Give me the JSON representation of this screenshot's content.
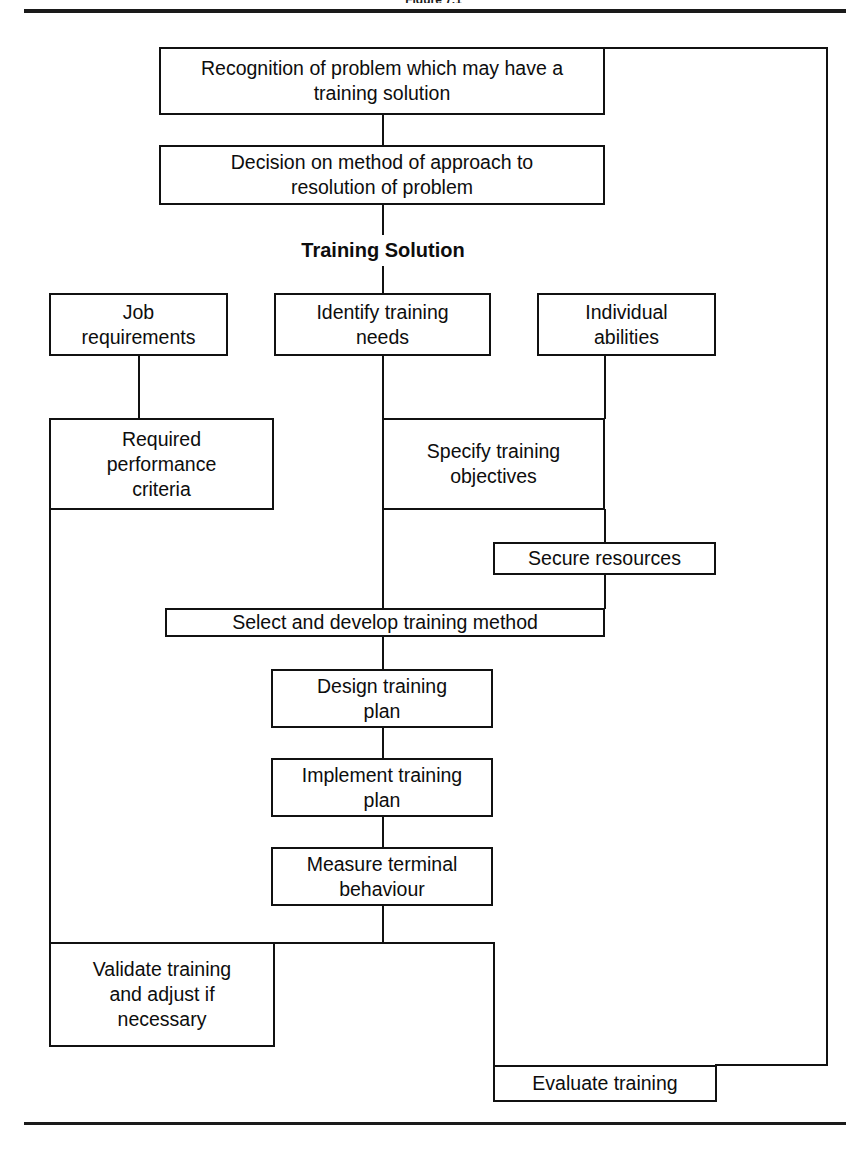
{
  "figure": {
    "caption": "Figure 7.1"
  },
  "diagram": {
    "stage_label": "Training Solution",
    "nodes": {
      "recognition": "Recognition of problem which may have a\ntraining solution",
      "decision": "Decision on method of approach to\nresolution of problem",
      "job_requirements": "Job\nrequirements",
      "identify_needs": "Identify training\nneeds",
      "individual_abilities": "Individual\nabilities",
      "required_performance": "Required\nperformance\ncriteria",
      "specify_objectives": "Specify training\nobjectives",
      "secure_resources": "Secure resources",
      "select_method": "Select and develop training method",
      "design_plan": "Design training\nplan",
      "implement_plan": "Implement training\nplan",
      "measure_behaviour": "Measure terminal\nbehaviour",
      "validate_training": "Validate training\nand adjust if\nnecessary",
      "evaluate_training": "Evaluate training"
    },
    "colors": {
      "stroke": "#111111",
      "background": "#ffffff",
      "text": "#0d0d0d"
    }
  }
}
